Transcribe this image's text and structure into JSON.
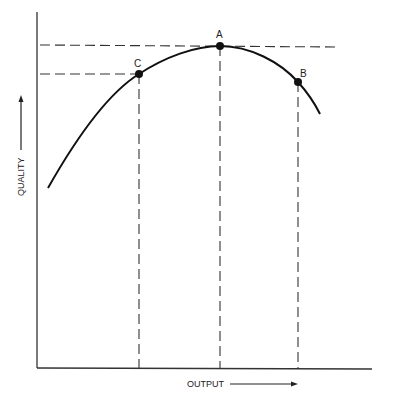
{
  "diagram": {
    "x_axis_label": "OUTPUT",
    "y_axis_label": "QUALITY",
    "points": [
      {
        "id": "A",
        "label": "A",
        "cx": 220,
        "cy": 46
      },
      {
        "id": "B",
        "label": "B",
        "cx": 298,
        "cy": 82
      },
      {
        "id": "C",
        "label": "C",
        "cx": 139,
        "cy": 74
      }
    ],
    "colors": {
      "line": "#1a1a1a",
      "background": "#ffffff"
    }
  }
}
